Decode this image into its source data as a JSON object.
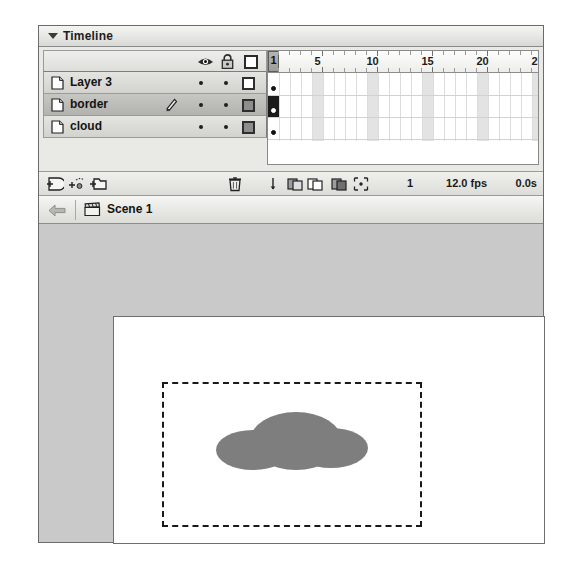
{
  "window": {
    "panel_title": "Timeline",
    "disclosure_icon": "triangle-down-icon"
  },
  "timeline": {
    "header_icons": [
      {
        "name": "eye-icon",
        "label": "Show/Hide All Layers"
      },
      {
        "name": "lock-icon",
        "label": "Lock/Unlock All Layers"
      },
      {
        "name": "outline-icon",
        "label": "Show All Layers as Outlines"
      }
    ],
    "layers": [
      {
        "name": "Layer 3",
        "icon": "layer-page-icon",
        "selected": false,
        "editing": false,
        "visible_dot": "•",
        "lock_dot": "•",
        "outline_swatch": "hollow",
        "outline_color": "#ffffff"
      },
      {
        "name": "border",
        "icon": "layer-page-icon",
        "selected": true,
        "editing": true,
        "edit_icon": "pencil-icon",
        "visible_dot": "•",
        "lock_dot": "•",
        "outline_swatch": "filled",
        "outline_color": "#8d8d8d"
      },
      {
        "name": "cloud",
        "icon": "layer-page-icon",
        "selected": false,
        "editing": false,
        "visible_dot": "•",
        "lock_dot": "•",
        "outline_swatch": "filled",
        "outline_color": "#8d8d8d"
      }
    ],
    "ruler": {
      "labels": [
        "1",
        "5",
        "10",
        "15",
        "20",
        "25"
      ],
      "label_frames": [
        1,
        5,
        10,
        15,
        20,
        25
      ],
      "frame_count": 26,
      "frame_width_px": 11,
      "shaded_every": 5,
      "playhead_frame": "1"
    },
    "keyframes": {
      "frame": 1,
      "layers_with_keyframe": [
        "Layer 3",
        "border",
        "cloud"
      ],
      "selected_layer_row": 1
    },
    "layer_tools": [
      {
        "name": "insert-layer-icon",
        "label": "Insert Layer"
      },
      {
        "name": "add-motion-guide-icon",
        "label": "Add Motion Guide"
      },
      {
        "name": "insert-layer-folder-icon",
        "label": "Insert Layer Folder"
      }
    ],
    "status": {
      "delete_icon": "trash-icon",
      "center_frame_icon": "center-frame-icon",
      "onion_skin_icon": "onion-skin-icon",
      "onion_skin_outlines_icon": "onion-skin-outlines-icon",
      "edit_multiple_frames_icon": "edit-multiple-frames-icon",
      "modify_onion_markers_icon": "modify-onion-markers-icon",
      "current_frame": "1",
      "frame_rate": "12.0 fps",
      "elapsed_time": "0.0s"
    }
  },
  "scene_bar": {
    "back_icon": "back-arrow-icon",
    "scene_icon": "scene-clapperboard-icon",
    "scene_name": "Scene 1"
  },
  "stage": {
    "work_area_color": "#c9c9c9",
    "stage_color": "#ffffff",
    "artboard": {
      "name": "border-rectangle",
      "border_style": "dashed",
      "border_color": "#191919"
    },
    "artwork": {
      "name": "cloud-shape",
      "fill_color": "#7e7e7e",
      "puffs": [
        "left-puff",
        "center-puff",
        "right-puff"
      ]
    }
  }
}
